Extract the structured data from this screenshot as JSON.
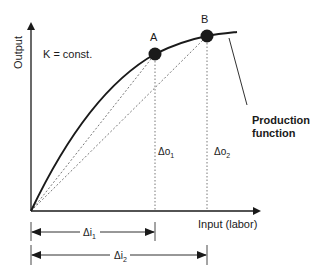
{
  "diagram": {
    "type": "production-function",
    "axes": {
      "y_label": "Output",
      "x_label": "Input (labor)"
    },
    "annotation": "K = const.",
    "points": [
      {
        "label": "A",
        "x": 155,
        "y": 54
      },
      {
        "label": "B",
        "x": 207,
        "y": 36
      }
    ],
    "curve_label_line1": "Production",
    "curve_label_line2": "function",
    "delta_output": [
      {
        "symbol": "Δo",
        "sub": "1"
      },
      {
        "symbol": "Δo",
        "sub": "2"
      }
    ],
    "delta_input": [
      {
        "symbol": "Δi",
        "sub": "1"
      },
      {
        "symbol": "Δi",
        "sub": "2"
      }
    ],
    "colors": {
      "ink": "#1a1a1a",
      "guide": "#555555"
    }
  }
}
